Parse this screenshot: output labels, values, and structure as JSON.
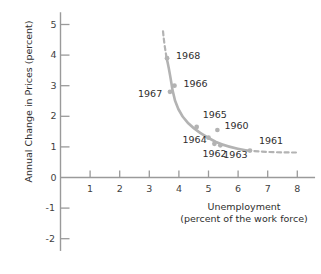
{
  "chart_data": {
    "type": "scatter",
    "title": "",
    "subtitle": "",
    "xlabel": "Unemployment (percent of the work force)",
    "ylabel": "Annual Change in Prices (percent)",
    "xlabel_line1": "Unemployment",
    "xlabel_line2": "(percent of the work force)",
    "xlim": [
      0,
      8.6
    ],
    "ylim": [
      -2.4,
      5.4
    ],
    "xticks": [
      1,
      2,
      3,
      4,
      5,
      6,
      7,
      8
    ],
    "xtick_labels": [
      "1",
      "2",
      "3",
      "4",
      "5",
      "6",
      "7",
      "8"
    ],
    "yticks": [
      -2,
      -1,
      0,
      1,
      2,
      3,
      4,
      5
    ],
    "ytick_labels": [
      "-2",
      "-1",
      "0",
      "1",
      "2",
      "3",
      "4",
      "5"
    ],
    "grid": false,
    "legend": "none",
    "series": [
      {
        "name": "Phillips curve observations",
        "point_color": "#b3b3b3",
        "points": [
          {
            "label": "1968",
            "x": 3.6,
            "y": 3.9,
            "on_curve": true,
            "label_dx": 9,
            "label_dy": -2
          },
          {
            "label": "1966",
            "x": 3.85,
            "y": 3.0,
            "on_curve": true,
            "label_dx": 9,
            "label_dy": -2
          },
          {
            "label": "1967",
            "x": 3.7,
            "y": 2.8,
            "on_curve": true,
            "label_dx": -32,
            "label_dy": 2
          },
          {
            "label": "1965",
            "x": 4.6,
            "y": 1.65,
            "on_curve": true,
            "label_dx": 6,
            "label_dy": -12
          },
          {
            "label": "1964",
            "x": 5.0,
            "y": 1.3,
            "on_curve": true,
            "label_dx": -26,
            "label_dy": 2
          },
          {
            "label": "1962",
            "x": 5.2,
            "y": 1.1,
            "on_curve": true,
            "label_dx": -12,
            "label_dy": 10
          },
          {
            "label": "1963",
            "x": 5.4,
            "y": 1.05,
            "on_curve": true,
            "label_dx": 3,
            "label_dy": 10
          },
          {
            "label": "1960",
            "x": 5.3,
            "y": 1.55,
            "on_curve": false,
            "label_dx": 7,
            "label_dy": -4
          },
          {
            "label": "1961",
            "x": 6.4,
            "y": 0.88,
            "on_curve": true,
            "label_dx": 9,
            "label_dy": -10
          }
        ]
      }
    ],
    "curve": {
      "name": "fitted-phillips-curve",
      "color": "#b3b3b3",
      "solid_path": "M 166.5,57.5 C 169.5,70 171,81 172.5,90 C 175,104 180,115 188,123 C 196,131 206,137 216,142 C 227,147 238,149 247,150.5",
      "dashed_top_path": "M 166.5,57.5 C 165,48 164,42 163,31",
      "dashed_right_path": "M 247,150.5 C 262,152 280,152.5 296,152.5",
      "dash_pattern": "4,3.5"
    },
    "axes": {
      "color": "#9a9a9a",
      "x_axis_y_value": 0,
      "y_axis_x_value": 0
    }
  },
  "figure": {
    "background": "#ffffff",
    "text_color": "#2e2e2e"
  }
}
